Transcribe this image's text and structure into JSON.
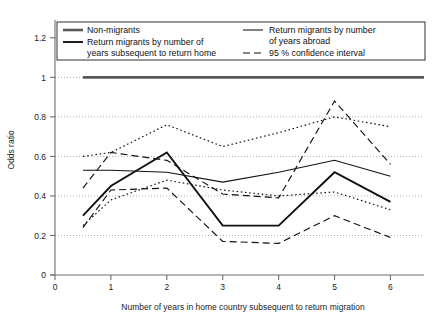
{
  "chart_data": {
    "type": "line",
    "title": "",
    "xlabel": "Number of years in home country subsequent to return migration",
    "ylabel": "Odds ratio",
    "xlim": [
      0,
      6.6
    ],
    "ylim": [
      0,
      1.28
    ],
    "xticks": [
      0,
      1,
      2,
      3,
      4,
      5,
      6
    ],
    "xtick_labels": [
      "0",
      "1",
      "2",
      "3",
      "4",
      "5",
      "6"
    ],
    "yticks": [
      0,
      0.2,
      0.4,
      0.6,
      0.8,
      1,
      1.2
    ],
    "ytick_labels": [
      "0",
      "0.2",
      "0.4",
      "0.6",
      "0.8",
      "1",
      "1.2"
    ],
    "grid": "horizontal-dotted",
    "legend_position": "top-inside",
    "x": [
      0.5,
      1,
      2,
      3,
      4,
      5,
      6
    ],
    "series": [
      {
        "name": "Non-migrants",
        "style": "solid-thick-gray",
        "color": "#585858",
        "values": [
          1,
          1,
          1,
          1,
          1,
          1,
          1
        ]
      },
      {
        "name": "Return migrants by number of years subsequent to return home",
        "style": "solid-thick",
        "color": "#111111",
        "values": [
          0.3,
          0.45,
          0.62,
          0.25,
          0.25,
          0.52,
          0.37
        ]
      },
      {
        "name": "Return migrants by number of years abroad",
        "style": "solid-thin",
        "color": "#111111",
        "values": [
          0.53,
          0.53,
          0.52,
          0.47,
          0.52,
          0.58,
          0.5
        ]
      },
      {
        "name": "95 % confidence interval (subsequent to return home, upper)",
        "style": "dashed",
        "color": "#111111",
        "values": [
          0.44,
          0.62,
          0.58,
          0.41,
          0.39,
          0.88,
          0.56
        ]
      },
      {
        "name": "95 % confidence interval (subsequent to return home, lower)",
        "style": "dashed",
        "color": "#111111",
        "values": [
          0.24,
          0.43,
          0.44,
          0.17,
          0.16,
          0.3,
          0.19
        ]
      },
      {
        "name": "95 % confidence interval (years abroad, upper)",
        "style": "dotted",
        "color": "#111111",
        "values": [
          0.6,
          0.62,
          0.76,
          0.65,
          0.72,
          0.8,
          0.75
        ]
      },
      {
        "name": "95 % confidence interval (years abroad, lower)",
        "style": "dotted",
        "color": "#111111",
        "values": [
          0.25,
          0.38,
          0.48,
          0.43,
          0.4,
          0.42,
          0.33
        ]
      }
    ]
  },
  "legend": {
    "items": [
      {
        "label_line1": "Non-migrants",
        "label_line2": "",
        "style": "solid-thick-gray"
      },
      {
        "label_line1": "Return migrants by number of",
        "label_line2": "years subsequent to return home",
        "style": "solid-thick"
      },
      {
        "label_line1": "Return migrants by number",
        "label_line2": "of years abroad",
        "style": "solid-thin"
      },
      {
        "label_line1": "95 % confidence interval",
        "label_line2": "",
        "style": "dashed"
      }
    ]
  },
  "colors": {
    "axis": "#6e6e6e",
    "grid": "#9a9a9a",
    "ink": "#111111",
    "nonmigrant": "#585858",
    "background": "#ffffff"
  }
}
